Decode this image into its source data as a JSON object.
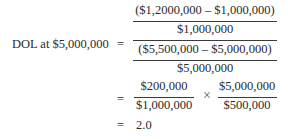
{
  "formula": {
    "lhs": "DOL at $5,000,000",
    "equals": "=",
    "step1": {
      "outer_numerator": {
        "numerator": "($1,2000,000 – $1,000,000)",
        "denominator": "$1,000,000"
      },
      "outer_denominator": {
        "numerator": "($5,500,000 – $5,000,000)",
        "denominator": "$5,000,000"
      }
    },
    "step2": {
      "frac1": {
        "numerator": "$200,000",
        "denominator": "$1,000,000"
      },
      "operator": "×",
      "frac2": {
        "numerator": "$5,000,000",
        "denominator": "$500,000"
      }
    },
    "result": "2.0"
  }
}
